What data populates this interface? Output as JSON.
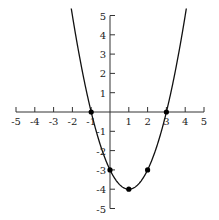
{
  "chart_data": {
    "type": "line",
    "title": "",
    "function": "y = x^2 - 2x - 3",
    "xlabel": "",
    "ylabel": "",
    "xlim": [
      -5,
      5
    ],
    "ylim": [
      -5,
      5
    ],
    "grid": false,
    "x_ticks": [
      -5,
      -4,
      -3,
      -2,
      -1,
      1,
      2,
      3,
      4,
      5
    ],
    "y_ticks": [
      -5,
      -4,
      -3,
      -2,
      -1,
      1,
      2,
      3,
      4,
      5
    ],
    "x_tick_labels": [
      "-5",
      "-4",
      "-3",
      "-2",
      "-1",
      "1",
      "2",
      "3",
      "4",
      "5"
    ],
    "y_tick_labels": [
      "-5",
      "-4",
      "-3",
      "-2",
      "-1",
      "1",
      "2",
      "3",
      "4",
      "5"
    ],
    "points": [
      {
        "x": -1,
        "y": 0
      },
      {
        "x": 0,
        "y": -3
      },
      {
        "x": 1,
        "y": -4
      },
      {
        "x": 2,
        "y": -3
      },
      {
        "x": 3,
        "y": 0
      }
    ],
    "curve_color": "#111111",
    "point_color": "#000000"
  }
}
